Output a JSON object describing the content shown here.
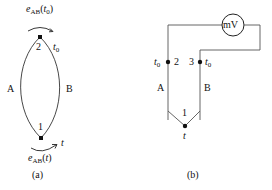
{
  "figure_a": {
    "caption": "(a)",
    "conductor_left": "A",
    "conductor_right": "B",
    "junction_top": {
      "label": "2",
      "temperature": "t0",
      "emf": "eAB(t0)"
    },
    "junction_bottom": {
      "label": "1",
      "temperature": "t",
      "emf": "eAB(t)"
    }
  },
  "figure_b": {
    "caption": "(b)",
    "meter": "mV",
    "conductor_left": "A",
    "conductor_right": "B",
    "junction_left": {
      "label": "2",
      "temperature": "t0"
    },
    "junction_right": {
      "label": "3",
      "temperature": "t0"
    },
    "junction_bottom": {
      "label": "1",
      "temperature": "t"
    }
  },
  "text": {
    "e": "e",
    "ab": "AB",
    "t": "t",
    "zero": "0",
    "lp": "(",
    "rp": ")"
  }
}
